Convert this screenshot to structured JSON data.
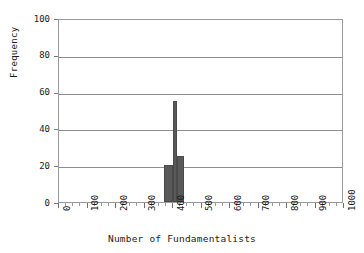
{
  "chart_data": {
    "type": "bar",
    "title": "",
    "xlabel": "Number of Fundamentalists",
    "ylabel": "Frequency",
    "xlim": [
      0,
      1000
    ],
    "ylim": [
      0,
      100
    ],
    "grid": "horizontal",
    "legend": "none",
    "bar_color": "#595959",
    "x_tick_labels": [
      "0",
      "100",
      "200",
      "300",
      "400",
      "500",
      "600",
      "700",
      "800",
      "900",
      "1000"
    ],
    "x_tick_values": [
      0,
      100,
      200,
      300,
      400,
      500,
      600,
      700,
      800,
      900,
      1000
    ],
    "x_minor_tick_step": 25,
    "y_tick_labels": [
      "0",
      "20",
      "40",
      "60",
      "80",
      "100"
    ],
    "y_tick_values": [
      0,
      20,
      40,
      60,
      80,
      100
    ],
    "bin_width": 30,
    "bars": [
      {
        "x_start": 370,
        "x_end": 400,
        "center": 385,
        "value": 20
      },
      {
        "x_start": 400,
        "x_end": 415,
        "center": 407,
        "value": 55
      },
      {
        "x_start": 415,
        "x_end": 437,
        "center": 426,
        "value": 25
      }
    ],
    "categories": [
      385,
      407,
      426
    ],
    "values": [
      20,
      55,
      25
    ]
  }
}
